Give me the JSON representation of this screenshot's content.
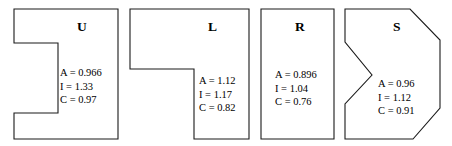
{
  "figure": {
    "type": "shape-metrics-figure",
    "background_color": "#ffffff",
    "stroke_color": "#1a1a1a",
    "text_color": "#000000"
  },
  "shapes": [
    {
      "id": "u",
      "label": "U",
      "shape_name": "u-shape",
      "description": "rectangle with a rectangular notch cut into the left side",
      "polygon": "14,9 118,9 118,139 14,139 14,113 58,113 58,43 14,43",
      "metrics": {
        "area_line": "A = 0.966",
        "inertia_line": "I = 1.33",
        "compactness_line": "C = 0.97",
        "A": 0.966,
        "I": 1.33,
        "C": 0.97
      }
    },
    {
      "id": "l",
      "label": "L",
      "shape_name": "l-shape",
      "description": "L shaped polygon, long arm across the top, leg descending on the right",
      "polygon": "130,9 249,9 249,139 194,139 194,69 130,69",
      "metrics": {
        "area_line": "A = 1.12",
        "inertia_line": "I = 1.17",
        "compactness_line": "C = 0.82",
        "A": 1.12,
        "I": 1.17,
        "C": 0.82
      }
    },
    {
      "id": "r",
      "label": "R",
      "shape_name": "rectangle-shape",
      "description": "plain upright rectangle",
      "polygon": "261,9 334,9 334,139 261,139",
      "metrics": {
        "area_line": "A = 0.896",
        "inertia_line": "I = 1.04",
        "compactness_line": "C = 0.76",
        "A": 0.896,
        "I": 1.04,
        "C": 0.76
      }
    },
    {
      "id": "s",
      "label": "S",
      "shape_name": "s-shape",
      "description": "polygon with chamfered right corners and a V notch on the left side",
      "polygon": "345,9 410,9 440,40 440,108 413,139 345,139 345,104 372,75 345,42",
      "metrics": {
        "area_line": "A = 0.96",
        "inertia_line": "I = 1.12",
        "compactness_line": "C = 0.91",
        "A": 0.96,
        "I": 1.12,
        "C": 0.91
      }
    }
  ]
}
